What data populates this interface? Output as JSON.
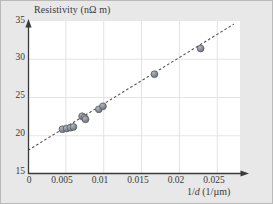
{
  "figure": {
    "background_color": "#e8e8e8",
    "plot_background_color": "#ffffff",
    "border_color": "#b9b9b9",
    "grid_color": "#e3e3e3",
    "axis_color": "#3a3a3a",
    "marker_color": "#8b8f97",
    "marker_edge_color": "#5a5e66",
    "trendline_color": "#555555"
  },
  "chart_data": {
    "type": "scatter",
    "title": "",
    "xlabel": "1/d (1/µm)",
    "ylabel": "Resistivity (nΩ m)",
    "xlim": [
      0,
      0.028
    ],
    "ylim": [
      15,
      35
    ],
    "xticks": [
      0,
      0.005,
      0.01,
      0.015,
      0.02,
      0.025
    ],
    "xtick_labels": [
      "0",
      "0.005",
      "0.01",
      "0.015",
      "0.02",
      "0.025"
    ],
    "yticks": [
      15,
      20,
      25,
      30,
      35
    ],
    "ytick_labels": [
      "15",
      "20",
      "25",
      "30",
      "35"
    ],
    "grid": true,
    "legend": false,
    "series": [
      {
        "name": "Resistivity measurements",
        "marker": "circle",
        "points": [
          {
            "x": 0.00455,
            "y": 20.85
          },
          {
            "x": 0.0051,
            "y": 20.95
          },
          {
            "x": 0.0056,
            "y": 21.05
          },
          {
            "x": 0.006,
            "y": 21.15
          },
          {
            "x": 0.00715,
            "y": 22.55
          },
          {
            "x": 0.00745,
            "y": 22.35
          },
          {
            "x": 0.0076,
            "y": 22.15
          },
          {
            "x": 0.00935,
            "y": 23.45
          },
          {
            "x": 0.0099,
            "y": 23.85
          },
          {
            "x": 0.0167,
            "y": 28.05
          },
          {
            "x": 0.0228,
            "y": 31.4
          }
        ]
      }
    ],
    "trendline": {
      "type": "linear-fit",
      "style": "dashed",
      "x_start": 0.0,
      "y_start": 18.1,
      "x_end": 0.0272,
      "y_end": 34.6
    }
  },
  "axes": {
    "y_title": "Resistivity (nΩ m)",
    "x_title_prefix": "1/",
    "x_title_italic": "d",
    "x_title_suffix": " (1/µm)"
  }
}
